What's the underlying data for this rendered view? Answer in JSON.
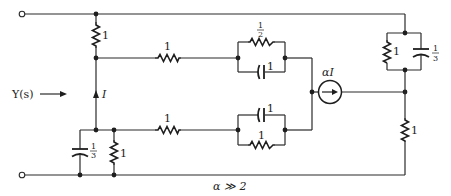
{
  "diagram": {
    "type": "circuit",
    "input_label": "Y(s)",
    "condition": "α ≫ 2",
    "controlling_current": "I",
    "dependent_source": {
      "label": "αI",
      "kind": "current-source",
      "direction": "right"
    },
    "components": {
      "r_left_top": {
        "value": "1",
        "kind": "resistor"
      },
      "r_upper_series": {
        "value": "1",
        "kind": "resistor"
      },
      "r_upper_parallel": {
        "value_num": "1",
        "value_den": "2",
        "kind": "resistor"
      },
      "c_upper_parallel": {
        "value": "1",
        "kind": "capacitor"
      },
      "r_lower_series": {
        "value": "1",
        "kind": "resistor"
      },
      "c_lower_parallel": {
        "value": "1",
        "kind": "capacitor"
      },
      "r_lower_parallel": {
        "value": "1",
        "kind": "resistor"
      },
      "c_left_bottom": {
        "value_num": "1",
        "value_den": "3",
        "kind": "capacitor"
      },
      "r_left_bottom": {
        "value": "1",
        "kind": "resistor"
      },
      "r_right_top": {
        "value": "1",
        "kind": "resistor"
      },
      "c_right_top": {
        "value_num": "1",
        "value_den": "3",
        "kind": "capacitor"
      },
      "r_right_bottom": {
        "value": "1",
        "kind": "resistor"
      }
    }
  }
}
